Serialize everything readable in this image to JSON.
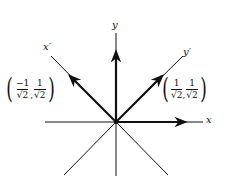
{
  "diagram": {
    "title": "",
    "origin": [
      116,
      122
    ],
    "axes": [
      {
        "name": "x",
        "label": "x"
      },
      {
        "name": "y",
        "label": "y"
      },
      {
        "name": "x-prime",
        "label": "x′"
      },
      {
        "name": "y-prime",
        "label": "y′"
      }
    ],
    "vectors": [
      {
        "name": "e1",
        "direction": "x"
      },
      {
        "name": "e2",
        "direction": "y"
      },
      {
        "name": "e1-prime",
        "direction": "x′",
        "label": {
          "open": "(",
          "num1": "−1",
          "den1": "√2",
          "comma": ",",
          "num2": "1",
          "den2": "√2",
          "close": ")"
        }
      },
      {
        "name": "e2-prime",
        "direction": "y′",
        "label": {
          "open": "(",
          "num1": "1",
          "den1": "√2",
          "comma": ",",
          "num2": "1",
          "den2": "√2",
          "close": ")"
        }
      }
    ],
    "colors": {
      "stroke": "#111111",
      "background": "#ffffff"
    }
  }
}
